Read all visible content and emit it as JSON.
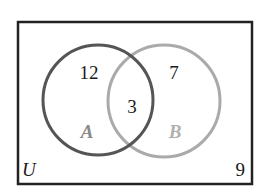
{
  "diagram": {
    "type": "venn",
    "universe": {
      "label": "U",
      "outside_count": "9",
      "border_color": "#222222"
    },
    "sets": [
      {
        "name": "A",
        "label": "A",
        "only_count": "12",
        "stroke_color": "#555555",
        "label_color": "#8a8a8a"
      },
      {
        "name": "B",
        "label": "B",
        "only_count": "7",
        "stroke_color": "#aaaaaa",
        "label_color": "#b0b0b0"
      }
    ],
    "intersection": {
      "sets": [
        "A",
        "B"
      ],
      "count": "3"
    }
  }
}
